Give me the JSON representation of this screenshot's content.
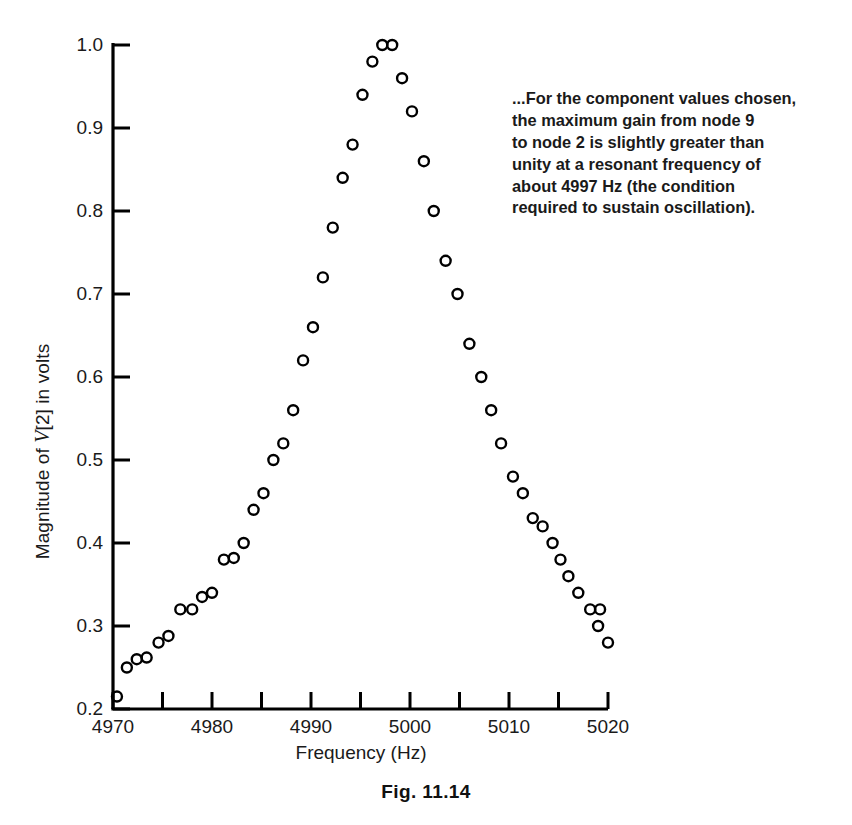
{
  "caption": "Fig. 11.14",
  "annotation": {
    "line1": "...For the component values chosen,",
    "line2": "the maximum gain from node 9",
    "line3": "to node  2 is slightly greater than",
    "line4": "unity at a resonant frequency of",
    "line5": "about 4997 Hz (the condition",
    "line6": "required to sustain oscillation)."
  },
  "axis": {
    "ylabel_prefix": "Magnitude of ",
    "ylabel_var": "V",
    "ylabel_suffix": "[2] in volts",
    "xlabel": "Frequency (Hz)",
    "ytick_labels": [
      "1.0",
      "0.9",
      "0.8",
      "0.7",
      "0.6",
      "0.5",
      "0.4",
      "0.3",
      "0.2"
    ],
    "xtick_labels": [
      "4970",
      "4980",
      "4990",
      "5000",
      "5010",
      "5020"
    ]
  },
  "chart_data": {
    "type": "scatter",
    "title": "Fig. 11.14",
    "xlabel": "Frequency (Hz)",
    "ylabel": "Magnitude of V[2] in volts",
    "xlim": [
      4970,
      5020
    ],
    "ylim": [
      0.2,
      1.0
    ],
    "xticks": [
      4970,
      4980,
      4990,
      5000,
      5010,
      5020
    ],
    "xminorticks": [
      4975,
      4985,
      4995,
      5005,
      5015
    ],
    "yticks": [
      0.2,
      0.3,
      0.4,
      0.5,
      0.6,
      0.7,
      0.8,
      0.9,
      1.0
    ],
    "grid": false,
    "legend": null,
    "marker": "open-circle",
    "series": [
      {
        "name": "Magnitude of V[2]",
        "x": [
          4970.4,
          4971.4,
          4972.4,
          4973.4,
          4974.6,
          4975.6,
          4976.8,
          4978.0,
          4979.0,
          4980.0,
          4981.2,
          4982.2,
          4983.2,
          4984.2,
          4985.2,
          4986.2,
          4987.2,
          4988.2,
          4989.2,
          4990.2,
          4991.2,
          4992.2,
          4993.2,
          4994.2,
          4995.2,
          4996.2,
          4997.2,
          4998.2,
          4999.2,
          5000.2,
          5001.4,
          5002.4,
          5003.6,
          5004.8,
          5006.0,
          5007.2,
          5008.2,
          5009.2,
          5010.4,
          5011.4,
          5012.4,
          5013.4,
          5014.4,
          5015.2,
          5016.0,
          5017.0,
          5018.2,
          5019.2
        ],
        "y": [
          0.215,
          0.25,
          0.26,
          0.262,
          0.28,
          0.288,
          0.32,
          0.32,
          0.335,
          0.34,
          0.38,
          0.382,
          0.4,
          0.44,
          0.46,
          0.5,
          0.52,
          0.56,
          0.62,
          0.66,
          0.72,
          0.78,
          0.84,
          0.88,
          0.94,
          0.98,
          1.0,
          1.0,
          0.96,
          0.92,
          0.86,
          0.8,
          0.74,
          0.7,
          0.64,
          0.6,
          0.56,
          0.52,
          0.48,
          0.46,
          0.43,
          0.42,
          0.4,
          0.38,
          0.36,
          0.34,
          0.32,
          0.32
        ],
        "marker": "open-circle",
        "color": "#000000"
      },
      {
        "name": "tail-extra",
        "x": [
          5019.0,
          5020.0
        ],
        "y": [
          0.3,
          0.28
        ],
        "marker": "open-circle",
        "color": "#000000"
      }
    ]
  },
  "colors": {
    "ink": "#1a1a1a",
    "axis": "#000000",
    "marker": "#000000",
    "background": "#ffffff"
  }
}
